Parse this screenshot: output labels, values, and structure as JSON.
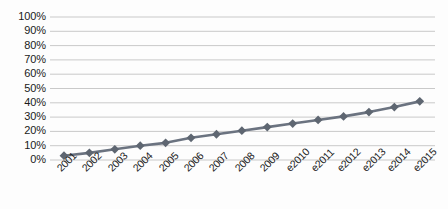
{
  "chart_data": {
    "type": "line",
    "title": "",
    "subtitle": "",
    "xlabel": "",
    "ylabel": "",
    "categories": [
      "2001",
      "2002",
      "2003",
      "2004",
      "2005",
      "2006",
      "2007",
      "2008",
      "2009",
      "e2010",
      "e2011",
      "e2012",
      "e2013",
      "e2014",
      "e2015"
    ],
    "values": [
      3,
      5,
      7.5,
      10,
      12,
      15.5,
      18,
      20.5,
      23,
      25.5,
      28,
      30.5,
      33.5,
      37,
      41
    ],
    "y_tick_labels": [
      "100%",
      "90%",
      "80%",
      "70%",
      "60%",
      "50%",
      "40%",
      "30%",
      "20%",
      "10%",
      "0%"
    ],
    "y_ticks": [
      100,
      90,
      80,
      70,
      60,
      50,
      40,
      30,
      20,
      10,
      0
    ],
    "ylim": [
      0,
      100
    ],
    "grid": true,
    "grid_axis": "y",
    "legend": false,
    "legend_position": "none",
    "series": [
      {
        "name": "Series 1",
        "marker": "diamond",
        "color": "#6b7380",
        "values": [
          3,
          5,
          7.5,
          10,
          12,
          15.5,
          18,
          20.5,
          23,
          25.5,
          28,
          30.5,
          33.5,
          37,
          41
        ]
      }
    ],
    "colors": {
      "line": "#6b7380",
      "marker": "#5e6671",
      "grid": "#c9c9c9",
      "axis_text": "#1a1a1a",
      "background": "#fdfdfd"
    }
  }
}
